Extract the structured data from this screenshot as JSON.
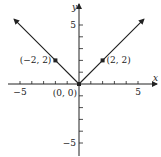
{
  "chart_data": {
    "type": "line",
    "title": "",
    "function": "y = |x|",
    "xlabel": "x",
    "ylabel": "y",
    "xlim": [
      -6,
      6
    ],
    "ylim": [
      -6,
      6
    ],
    "x_ticks": [
      -5,
      -4,
      -3,
      -2,
      -1,
      1,
      2,
      3,
      4,
      5
    ],
    "y_ticks": [
      -5,
      -4,
      -3,
      -2,
      -1,
      1,
      2,
      3,
      4,
      5
    ],
    "x_tick_labels": [
      {
        "value": -5,
        "label": "−5"
      },
      {
        "value": 5,
        "label": "5"
      }
    ],
    "y_tick_labels": [
      {
        "value": 5,
        "label": "5"
      },
      {
        "value": -5,
        "label": "−5"
      }
    ],
    "grid": false,
    "series": [
      {
        "name": "y = |x|",
        "x": [
          -5.5,
          -2,
          0,
          2,
          5.5
        ],
        "y": [
          5.5,
          2,
          0,
          2,
          5.5
        ],
        "arrows_at_ends": true
      }
    ],
    "points": [
      {
        "x": -2,
        "y": 2,
        "label": "(−2, 2)"
      },
      {
        "x": 0,
        "y": 0,
        "label": "(0, 0)"
      },
      {
        "x": 2,
        "y": 2,
        "label": "(2, 2)"
      }
    ]
  }
}
